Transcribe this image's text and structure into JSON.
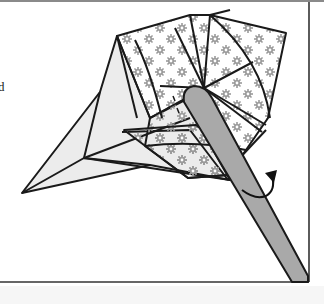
{
  "page": {
    "side_text_fragment": "d"
  },
  "diagram": {
    "elements": [
      {
        "name": "patterned-paper",
        "pattern": "gray flower/star dots on white"
      },
      {
        "name": "plain-wing",
        "fill": "light gray"
      },
      {
        "name": "pencil-tool",
        "fill": "gray rod pressing center"
      },
      {
        "name": "rotate-arrow",
        "meaning": "twist / turn"
      }
    ]
  },
  "colors": {
    "outline": "#1a1a1a",
    "wing_fill": "#ececec",
    "pattern_dot": "#9a9a9a",
    "pencil_fill": "#a9a9a9",
    "frame": "#333333",
    "top_rule": "#8a8a8a"
  }
}
